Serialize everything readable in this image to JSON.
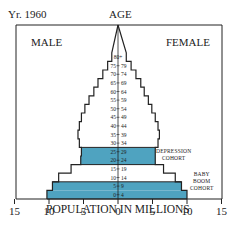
{
  "header": {
    "year_label": "Yr. 1960",
    "age_label": "AGE",
    "male_label": "MALE",
    "female_label": "FEMALE"
  },
  "annotations": {
    "depression": [
      "DEPRESSION",
      "COHORT"
    ],
    "baby_boom": [
      "BABY",
      "BOOM",
      "COHORT"
    ]
  },
  "colors": {
    "highlight": "#4fa3c0",
    "outline": "#222222"
  },
  "chart_data": {
    "type": "bar",
    "subtype": "population-pyramid",
    "title": "Yr. 1960",
    "xlabel": "POPULATION IN MILLIONS",
    "ylabel": "AGE",
    "xlim": [
      -15,
      15
    ],
    "x_ticks": [
      15,
      10,
      5,
      0,
      5,
      10,
      15
    ],
    "grid": false,
    "legend": [
      "MALE",
      "FEMALE"
    ],
    "categories": [
      "0-4",
      "5-9",
      "10-14",
      "15-19",
      "20-24",
      "25-29",
      "30-34",
      "35-39",
      "40-44",
      "45-49",
      "50-54",
      "55-59",
      "60-64",
      "65-69",
      "70-74",
      "75-79",
      "80+"
    ],
    "series": [
      {
        "name": "MALE",
        "values": [
          10.3,
          9.5,
          8.6,
          6.8,
          5.4,
          5.3,
          5.6,
          5.8,
          5.6,
          5.3,
          4.8,
          4.2,
          3.5,
          2.9,
          2.2,
          1.5,
          0.9
        ]
      },
      {
        "name": "FEMALE",
        "values": [
          10.0,
          9.2,
          8.3,
          6.6,
          5.4,
          5.4,
          5.8,
          6.0,
          5.8,
          5.4,
          4.9,
          4.4,
          3.8,
          3.3,
          2.6,
          1.9,
          1.2
        ]
      }
    ],
    "highlighted_groups": {
      "DEPRESSION COHORT": [
        "20-24",
        "25-29"
      ],
      "BABY BOOM COHORT": [
        "0-4",
        "5-9"
      ]
    }
  }
}
